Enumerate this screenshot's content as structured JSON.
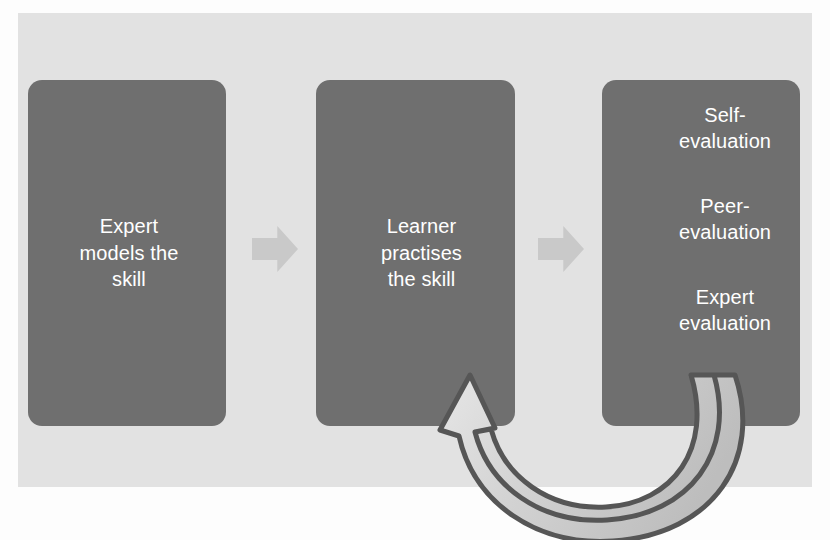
{
  "diagram": {
    "background_color": "#e2e2e2",
    "page_color": "#fdfdfd",
    "box_fill": "#6f6f6f",
    "box_text_color": "#ffffff",
    "chevron_color": "#c9c9c9",
    "feedback_arrow_outline": "#565656",
    "feedback_arrow_fill": "#cfcfcf"
  },
  "boxes": [
    {
      "id": "expert-models",
      "lines": [
        "Expert",
        "models the",
        "skill"
      ],
      "text": "Expert models the skill"
    },
    {
      "id": "learner-practises",
      "lines": [
        "Learner",
        "practises",
        "the skill"
      ],
      "text": "Learner practises the skill"
    },
    {
      "id": "evaluation",
      "lines": [
        "Self-\nevaluation",
        "Peer-\nevaluation",
        "Expert\nevaluation"
      ],
      "items": [
        {
          "line1": "Self-",
          "line2": "evaluation"
        },
        {
          "line1": "Peer-",
          "line2": "evaluation"
        },
        {
          "line1": "Expert",
          "line2": "evaluation"
        }
      ]
    }
  ],
  "connectors": [
    {
      "id": "arrow-1-to-2",
      "icon": "chevron-right-icon",
      "direction": "right"
    },
    {
      "id": "arrow-2-to-3",
      "icon": "chevron-right-icon",
      "direction": "right"
    },
    {
      "id": "feedback-loop",
      "icon": "curved-feedback-arrow-icon",
      "from": "evaluation",
      "to": "learner-practises",
      "direction": "loop-back"
    }
  ]
}
